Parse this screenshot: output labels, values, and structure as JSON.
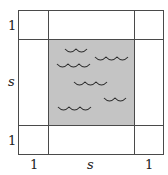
{
  "diagram": {
    "colors": {
      "line": "#4a4a4a",
      "pool_fill": "#c4c4c4",
      "border_fill": "#ffffff",
      "wave": "#2a2a2a"
    },
    "labels": {
      "left_top": "1",
      "left_middle": "s",
      "left_bottom": "1",
      "bottom_left": "1",
      "bottom_middle": "s",
      "bottom_right": "1"
    },
    "regions": {
      "pool": "water",
      "border": "walkway"
    }
  }
}
